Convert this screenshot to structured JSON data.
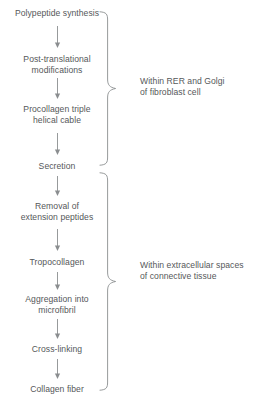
{
  "diagram": {
    "background_color": "#ffffff",
    "text_color": "#55585a",
    "line_color": "#8b8e90",
    "steps": [
      {
        "id": "polypeptide-synthesis",
        "label": "Polypeptide synthesis",
        "top": 8
      },
      {
        "id": "post-translational-modifications",
        "label": "Post-translational\nmodifications",
        "top": 54
      },
      {
        "id": "procollagen-triple-helical-cable",
        "label": "Procollagen triple\nhelical cable",
        "top": 104
      },
      {
        "id": "secretion",
        "label": "Secretion",
        "top": 161
      },
      {
        "id": "removal-of-extension-peptides",
        "label": "Removal of\nextension peptides",
        "top": 201
      },
      {
        "id": "tropocollagen",
        "label": "Tropocollagen",
        "top": 257
      },
      {
        "id": "aggregation-into-microfibril",
        "label": "Aggregation into\nmicrofibril",
        "top": 294
      },
      {
        "id": "cross-linking",
        "label": "Cross-linking",
        "top": 344
      },
      {
        "id": "collagen-fiber",
        "label": "Collagen fiber",
        "top": 384
      }
    ],
    "arrows": [
      {
        "id": "arrow-1",
        "from": "polypeptide-synthesis",
        "to": "post-translational-modifications",
        "top": 26,
        "length": 22
      },
      {
        "id": "arrow-2",
        "from": "post-translational-modifications",
        "to": "procollagen-triple-helical-cable",
        "top": 78,
        "length": 21
      },
      {
        "id": "arrow-3",
        "from": "procollagen-triple-helical-cable",
        "to": "secretion",
        "top": 133,
        "length": 22
      },
      {
        "id": "arrow-4",
        "from": "secretion",
        "to": "removal-of-extension-peptides",
        "top": 176,
        "length": 20
      },
      {
        "id": "arrow-5",
        "from": "removal-of-extension-peptides",
        "to": "tropocollagen",
        "top": 229,
        "length": 22
      },
      {
        "id": "arrow-6",
        "from": "tropocollagen",
        "to": "aggregation-into-microfibril",
        "top": 272,
        "length": 18
      },
      {
        "id": "arrow-7",
        "from": "aggregation-into-microfibril",
        "to": "cross-linking",
        "top": 319,
        "length": 20
      },
      {
        "id": "arrow-8",
        "from": "cross-linking",
        "to": "collagen-fiber",
        "top": 359,
        "length": 20
      }
    ],
    "groups": [
      {
        "id": "rer-golgi-group",
        "label": "Within RER and Golgi\nof fibroblast cell",
        "label_left": 140,
        "label_top": 76,
        "brace_top": 11,
        "brace_height": 155,
        "covers": [
          "polypeptide-synthesis",
          "post-translational-modifications",
          "procollagen-triple-helical-cable",
          "secretion"
        ]
      },
      {
        "id": "extracellular-group",
        "label": "Within extracellular spaces\nof connective tissue",
        "label_left": 140,
        "label_top": 260,
        "brace_top": 172,
        "brace_height": 219,
        "covers": [
          "removal-of-extension-peptides",
          "tropocollagen",
          "aggregation-into-microfibril",
          "cross-linking",
          "collagen-fiber"
        ]
      }
    ]
  }
}
